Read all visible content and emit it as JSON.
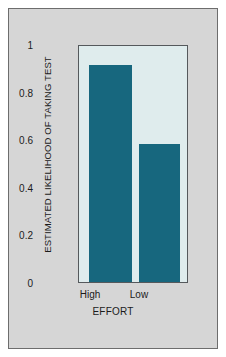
{
  "chart_data": {
    "type": "bar",
    "title": "",
    "categories": [
      "High",
      "Low"
    ],
    "values": [
      0.92,
      0.585
    ],
    "xlabel": "EFFORT",
    "ylabel": "ESTIMATED LIKELIHOOD OF TAKING TEST",
    "ylim": [
      0,
      1
    ],
    "yticks": [
      "0",
      "0.2",
      "0.4",
      "0.6",
      "0.8",
      "1"
    ],
    "ytick_values": [
      0,
      0.2,
      0.4,
      0.6,
      0.8,
      1
    ],
    "grid": false,
    "legend": null,
    "bar_color": "#17677e",
    "plot_background": "#dfeced",
    "figure_background": "#d6d6d6",
    "frame_color": "#55595c"
  }
}
